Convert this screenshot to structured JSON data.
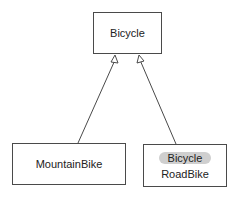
{
  "diagram": {
    "type": "uml-class-inheritance",
    "classes": [
      {
        "id": "bicycle",
        "label": "Bicycle"
      },
      {
        "id": "mountainbike",
        "label": "MountainBike"
      },
      {
        "id": "roadbike",
        "label": "RoadBike",
        "stereotype_tag": "Bicycle"
      }
    ],
    "relations": [
      {
        "from": "mountainbike",
        "to": "bicycle",
        "kind": "generalization"
      },
      {
        "from": "roadbike",
        "to": "bicycle",
        "kind": "generalization"
      }
    ]
  }
}
